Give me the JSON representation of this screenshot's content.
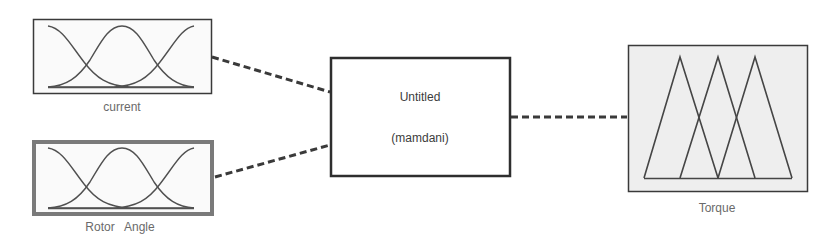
{
  "diagram": {
    "type": "fuzzy-inference-system",
    "system": {
      "name": "Untitled",
      "method": "(mamdani)"
    },
    "inputs": [
      {
        "name": "current",
        "membership_function_shape": "gaussian",
        "membership_function_count": 3,
        "selected": false
      },
      {
        "name": "Rotor   Angle",
        "membership_function_shape": "gaussian",
        "membership_function_count": 3,
        "selected": true
      }
    ],
    "outputs": [
      {
        "name": "Torque",
        "membership_function_shape": "triangular",
        "membership_function_count": 3
      }
    ],
    "connectors": [
      {
        "from": "current",
        "to": "Untitled",
        "style": "dashed"
      },
      {
        "from": "Rotor   Angle",
        "to": "Untitled",
        "style": "dashed"
      },
      {
        "from": "Untitled",
        "to": "Torque",
        "style": "dashed"
      }
    ]
  },
  "colors": {
    "line": "#3a3a3a",
    "label_text": "#6a6a6a",
    "system_text": "#3c3c3c",
    "output_fill": "#eeeeee",
    "box_fill": "#fafafa",
    "selected_border": "#7a7a7a"
  }
}
